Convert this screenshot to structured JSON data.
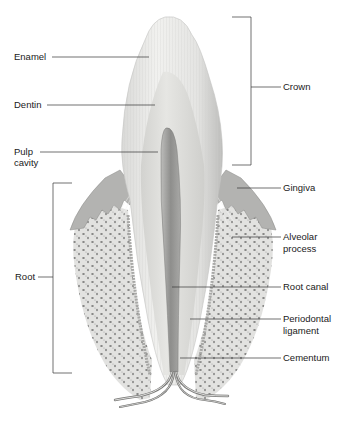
{
  "figure": {
    "colors": {
      "background": "#ffffff",
      "enamel": "#e9e9e7",
      "dentin": "#dcdcd9",
      "pulp": "#9d9d9b",
      "gingiva": "#b5b5b3",
      "bone": "#e0e0de",
      "bone_pores": "#6a6a6a",
      "leader_line": "#333333",
      "text": "#1a1a1a"
    }
  },
  "labels": {
    "enamel": "Enamel",
    "dentin": "Dentin",
    "pulp_line1": "Pulp",
    "pulp_line2": "cavity",
    "root": "Root",
    "crown": "Crown",
    "gingiva": "Gingiva",
    "alveolar_line1": "Alveolar",
    "alveolar_line2": "process",
    "root_canal": "Root canal",
    "periodontal_line1": "Periodontal",
    "periodontal_line2": "ligament",
    "cementum": "Cementum"
  }
}
